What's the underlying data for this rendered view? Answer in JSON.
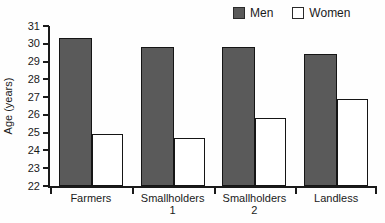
{
  "chart_data": {
    "type": "bar",
    "title": "",
    "xlabel": "",
    "ylabel": "Age (years)",
    "categories": [
      "Farmers",
      "Smallholders\n1",
      "Smallholders\n2",
      "Landless"
    ],
    "series": [
      {
        "name": "Men",
        "color": "#5a5a5a",
        "values": [
          30.3,
          29.8,
          29.8,
          29.4
        ]
      },
      {
        "name": "Women",
        "color": "#ffffff",
        "values": [
          24.9,
          24.7,
          25.8,
          26.9
        ]
      }
    ],
    "ylim": [
      22,
      31
    ],
    "ytick_step": 1,
    "grid": false,
    "legend_position": "top-right",
    "axis_color": "#1a1a1a"
  }
}
